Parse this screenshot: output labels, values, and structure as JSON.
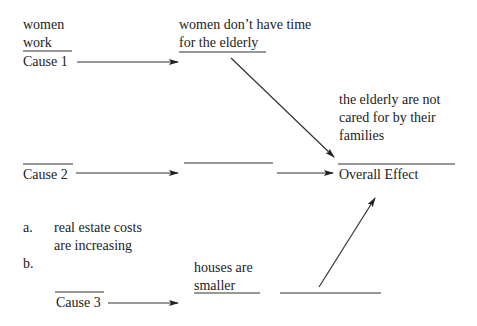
{
  "diagram": {
    "type": "cause-effect",
    "cause1": {
      "label": "Cause 1",
      "text_line1": "women",
      "text_line2": "work",
      "result_line1": "women don’t have time",
      "result_line2": "for the elderly"
    },
    "cause2": {
      "label": "Cause 2",
      "intermediate_blank": ""
    },
    "cause3": {
      "label": "Cause 3",
      "list": [
        {
          "marker": "a.",
          "line1": "real estate costs",
          "line2": "are increasing"
        },
        {
          "marker": "b.",
          "line1": ""
        }
      ],
      "result_line1": "houses are",
      "result_line2": "smaller",
      "intermediate_blank": ""
    },
    "effect": {
      "label": "Overall Effect",
      "text_line1": "the elderly are not",
      "text_line2": "cared for by their",
      "text_line3": "families"
    }
  },
  "colors": {
    "ink": "#222222",
    "background": "#ffffff"
  }
}
